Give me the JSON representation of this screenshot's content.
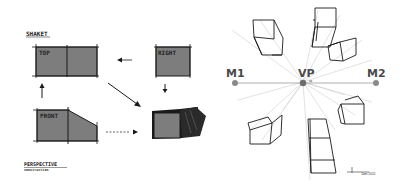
{
  "sketch": {
    "sheet_label": "SHAKET",
    "views": [
      {
        "id": "top",
        "label": "TOP"
      },
      {
        "id": "right",
        "label": "RIGHT"
      },
      {
        "id": "front",
        "label": "FRONT"
      }
    ],
    "caption_title": "PERSPECTIVE",
    "caption_sub": "construction",
    "signature": "Jam 2011"
  },
  "perspective": {
    "m1_label": "M1",
    "vp_label": "VP",
    "m2_label": "M2",
    "vp_small": "vp"
  },
  "colors": {
    "fill_gray": "#7d7d7d",
    "ink": "#1a1a1a",
    "point_gray": "#8a8a8a",
    "guide_gray": "#bdbdbd"
  }
}
